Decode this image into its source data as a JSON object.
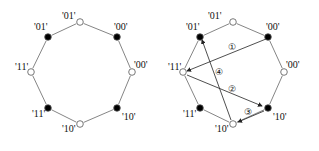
{
  "diagrams": [
    {
      "name": "left",
      "nodes": [
        {
          "id": "n0",
          "x": 80,
          "y": 22,
          "filled": false,
          "label": "'01'",
          "lx": 62,
          "ly": 19
        },
        {
          "id": "n1",
          "x": 48,
          "y": 37,
          "filled": true,
          "label": "'01'",
          "lx": 34,
          "ly": 30
        },
        {
          "id": "n2",
          "x": 31,
          "y": 72,
          "filled": false,
          "label": "'11'",
          "lx": 15,
          "ly": 70
        },
        {
          "id": "n3",
          "x": 48,
          "y": 108,
          "filled": true,
          "label": "'11'",
          "lx": 32,
          "ly": 117
        },
        {
          "id": "n4",
          "x": 80,
          "y": 124,
          "filled": false,
          "label": "'10'",
          "lx": 62,
          "ly": 132
        },
        {
          "id": "n5",
          "x": 117,
          "y": 108,
          "filled": true,
          "label": "'10'",
          "lx": 122,
          "ly": 120
        },
        {
          "id": "n6",
          "x": 132,
          "y": 72,
          "filled": false,
          "label": "'00'",
          "lx": 134,
          "ly": 68
        },
        {
          "id": "n7",
          "x": 117,
          "y": 37,
          "filled": true,
          "label": "'00'",
          "lx": 114,
          "ly": 30
        }
      ],
      "arrows": []
    },
    {
      "name": "right",
      "nodes": [
        {
          "id": "m0",
          "x": 233,
          "y": 22,
          "filled": false,
          "label": "'01'",
          "lx": 208,
          "ly": 19
        },
        {
          "id": "m1",
          "x": 200,
          "y": 37,
          "filled": true,
          "label": "'01'",
          "lx": 186,
          "ly": 30
        },
        {
          "id": "m2",
          "x": 183,
          "y": 72,
          "filled": false,
          "label": "'11'",
          "lx": 168,
          "ly": 70
        },
        {
          "id": "m3",
          "x": 200,
          "y": 108,
          "filled": true,
          "label": "'11'",
          "lx": 183,
          "ly": 117
        },
        {
          "id": "m4",
          "x": 233,
          "y": 124,
          "filled": false,
          "label": "'10'",
          "lx": 215,
          "ly": 132
        },
        {
          "id": "m5",
          "x": 268,
          "y": 108,
          "filled": true,
          "label": "'10'",
          "lx": 273,
          "ly": 120
        },
        {
          "id": "m6",
          "x": 284,
          "y": 72,
          "filled": false,
          "label": "'00'",
          "lx": 286,
          "ly": 68
        },
        {
          "id": "m7",
          "x": 268,
          "y": 37,
          "filled": true,
          "label": "'00'",
          "lx": 266,
          "ly": 30
        }
      ],
      "arrows": [
        {
          "step": "①",
          "from": [
            266,
            39
          ],
          "to": [
            187,
            71
          ],
          "nx": 232,
          "ny": 50
        },
        {
          "step": "②",
          "from": [
            187,
            75
          ],
          "to": [
            262,
            106
          ],
          "nx": 232,
          "ny": 92
        },
        {
          "step": "③",
          "from": [
            264,
            111
          ],
          "to": [
            238,
            122
          ],
          "nx": 248,
          "ny": 115
        },
        {
          "step": "④",
          "from": [
            231,
            120
          ],
          "to": [
            202,
            40
          ],
          "nx": 219,
          "ny": 75
        }
      ]
    }
  ]
}
